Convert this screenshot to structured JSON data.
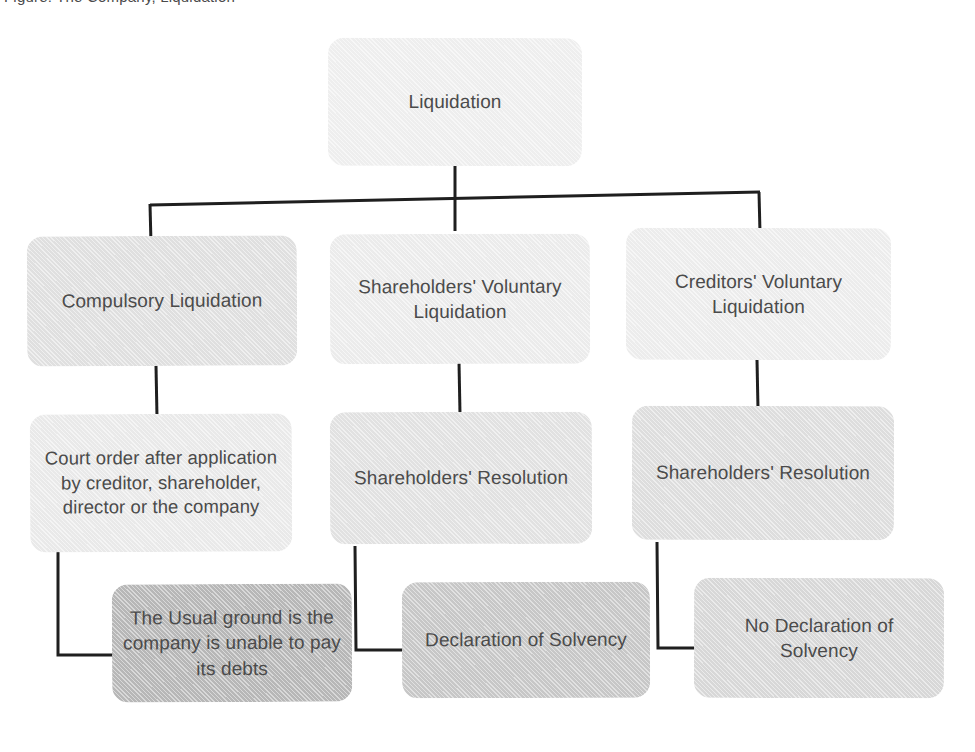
{
  "page": {
    "caption_partial": "Figure: The Company, Liquidation",
    "background_color": "#ffffff",
    "line_color": "#1f1f1f",
    "text_color": "#4b4b4b"
  },
  "diagram": {
    "type": "flowchart",
    "title": "Liquidation",
    "nodes": [
      {
        "id": "liquidation",
        "label": "Liquidation",
        "level": 1,
        "fill": "#f1f1f1",
        "x": 328,
        "y": 38,
        "w": 254,
        "h": 128
      },
      {
        "id": "compulsory",
        "label": "Compulsory Liquidation",
        "level": 2,
        "fill": "#e2e2e2",
        "x": 27,
        "y": 236,
        "w": 270,
        "h": 130
      },
      {
        "id": "svl",
        "label": "Shareholders' Voluntary Liquidation",
        "level": 2,
        "fill": "#eeeeee",
        "x": 330,
        "y": 234,
        "w": 260,
        "h": 130
      },
      {
        "id": "cvl",
        "label": "Creditors' Voluntary Liquidation",
        "level": 2,
        "fill": "#efefef",
        "x": 626,
        "y": 228,
        "w": 265,
        "h": 132
      },
      {
        "id": "court-order",
        "label": "Court order after application by creditor, shareholder, director or the company",
        "level": 3,
        "fill": "#ececec",
        "x": 30,
        "y": 414,
        "w": 262,
        "h": 138
      },
      {
        "id": "sh-resolution-1",
        "label": "Shareholders' Resolution",
        "level": 3,
        "fill": "#e4e4e4",
        "x": 330,
        "y": 412,
        "w": 262,
        "h": 132
      },
      {
        "id": "sh-resolution-2",
        "label": "Shareholders' Resolution",
        "level": 3,
        "fill": "#e0e0e0",
        "x": 632,
        "y": 406,
        "w": 262,
        "h": 134
      },
      {
        "id": "usual-ground",
        "label": "The Usual ground is the company is unable to pay its debts",
        "level": 4,
        "fill": "#b9b9b9",
        "x": 112,
        "y": 584,
        "w": 240,
        "h": 118
      },
      {
        "id": "declaration",
        "label": "Declaration of Solvency",
        "level": 4,
        "fill": "#c9c9c9",
        "x": 402,
        "y": 582,
        "w": 248,
        "h": 116
      },
      {
        "id": "no-declaration",
        "label": "No Declaration of Solvency",
        "level": 4,
        "fill": "#dadada",
        "x": 694,
        "y": 578,
        "w": 250,
        "h": 120
      }
    ],
    "edges": [
      {
        "from": "liquidation",
        "to": "compulsory",
        "style": "bus"
      },
      {
        "from": "liquidation",
        "to": "svl",
        "style": "bus"
      },
      {
        "from": "liquidation",
        "to": "cvl",
        "style": "bus"
      },
      {
        "from": "compulsory",
        "to": "court-order",
        "style": "straight"
      },
      {
        "from": "svl",
        "to": "sh-resolution-1",
        "style": "straight"
      },
      {
        "from": "cvl",
        "to": "sh-resolution-2",
        "style": "straight"
      },
      {
        "from": "court-order",
        "to": "usual-ground",
        "style": "elbow"
      },
      {
        "from": "sh-resolution-1",
        "to": "declaration",
        "style": "elbow"
      },
      {
        "from": "sh-resolution-2",
        "to": "no-declaration",
        "style": "elbow"
      }
    ]
  }
}
